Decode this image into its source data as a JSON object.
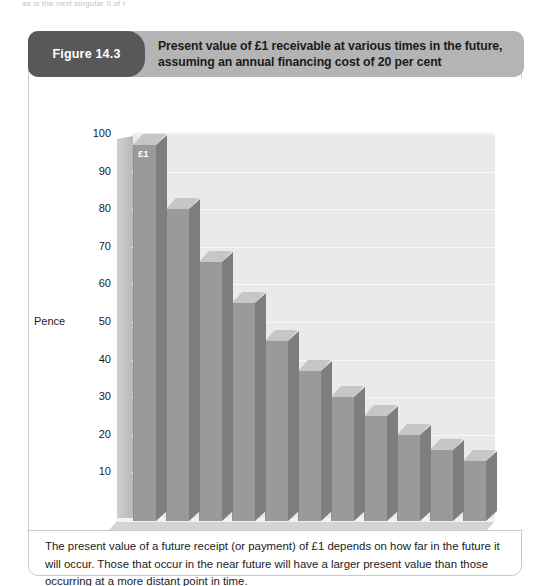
{
  "page": {
    "cropped_top_text": "as is the next singular 0 of r"
  },
  "figure": {
    "number_label": "Figure 14.3",
    "title": "Present value of £1 receivable at various times in the future, assuming an annual financing cost of 20 per cent",
    "caption": "The present value of a future receipt (or payment) of £1 depends on how far in the future it will occur. Those that occur in the near future will have a larger present value than those occurring at a more distant point in time.",
    "colors": {
      "header_band": "#b4b4b4",
      "pill": "#58585a",
      "bar_face": "#9a9a9a",
      "bar_side": "#7e7e7e",
      "bar_top": "#c6c6c6",
      "plot_background": "#eaeaea",
      "card_border": "#c9c9c9"
    }
  },
  "chart_data": {
    "type": "bar",
    "title": "Present value of £1 receivable at various times in the future, assuming an annual financing cost of 20 per cent",
    "xlabel": "Years into the future",
    "ylabel": "Pence",
    "categories": [
      "0",
      "1",
      "2",
      "3",
      "4",
      "5",
      "6",
      "7",
      "8",
      "9",
      "10"
    ],
    "values": [
      100,
      83,
      69,
      58,
      48,
      40,
      33,
      28,
      23,
      19,
      16
    ],
    "ylim": [
      0,
      100
    ],
    "yticks": [
      10,
      20,
      30,
      40,
      50,
      60,
      70,
      80,
      90,
      100
    ],
    "ytick_labels": [
      "10",
      "20",
      "30",
      "40",
      "50",
      "60",
      "70",
      "80",
      "90",
      "100"
    ],
    "xtick_labels": [
      "0",
      "1",
      "2",
      "3",
      "4",
      "5",
      "6",
      "7",
      "8",
      "9",
      "10"
    ],
    "grid": true,
    "legend": null,
    "annotations": [
      {
        "text": "£1",
        "category": "0",
        "value": 100
      }
    ],
    "style": "3d-bar",
    "series": [
      {
        "name": "Present value (pence)",
        "values": [
          100,
          83,
          69,
          58,
          48,
          40,
          33,
          28,
          23,
          19,
          16
        ]
      }
    ]
  }
}
